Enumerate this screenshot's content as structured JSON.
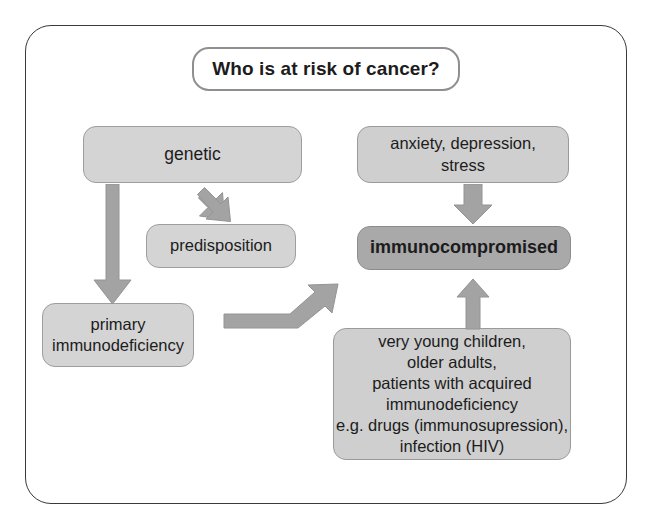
{
  "diagram": {
    "title": "Who is at risk of cancer?",
    "frame_color": "#3a3a3a",
    "arrow_color": "#9e9e9e",
    "nodes": [
      {
        "id": "genetic",
        "label": "genetic",
        "fill": "#d4d4d4"
      },
      {
        "id": "anxiety",
        "label": "anxiety, depression,\nstress",
        "fill": "#cfcfcf"
      },
      {
        "id": "predisposition",
        "label": "predisposition",
        "fill": "#d4d4d4"
      },
      {
        "id": "immunocompromised",
        "label": "immunocompromised",
        "fill": "#a9a9a9"
      },
      {
        "id": "primary",
        "label": "primary\nimmunodeficiency",
        "fill": "#d4d4d4"
      },
      {
        "id": "groups",
        "label": "very young children,\nolder adults,\npatients with acquired\nimmunodeficiency\ne.g. drugs (immunosupression),\ninfection (HIV)",
        "fill": "#cfcfcf"
      }
    ],
    "arrows": [
      {
        "id": "genetic-to-primary",
        "from": "genetic",
        "to": "primary",
        "direction": "down"
      },
      {
        "id": "genetic-to-predisposition",
        "from": "genetic",
        "to": "predisposition",
        "direction": "down-right"
      },
      {
        "id": "primary-to-immunocompromised",
        "from": "primary",
        "to": "immunocompromised",
        "direction": "elbow-up-right"
      },
      {
        "id": "anxiety-to-immunocompromised",
        "from": "anxiety",
        "to": "immunocompromised",
        "direction": "down"
      },
      {
        "id": "groups-to-immunocompromised",
        "from": "groups",
        "to": "immunocompromised",
        "direction": "up"
      }
    ]
  }
}
